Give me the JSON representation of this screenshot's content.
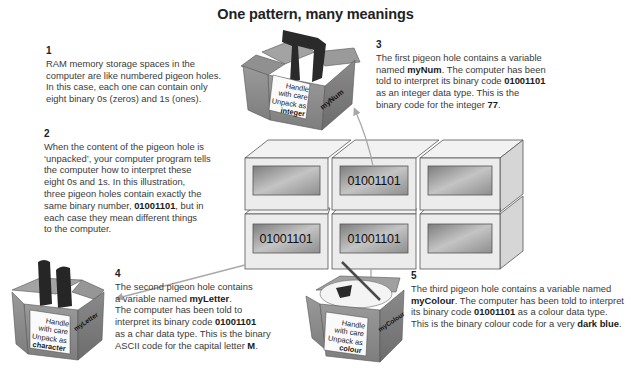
{
  "title": "One pattern, many meanings",
  "binary": "01001101",
  "steps": [
    {
      "number": "1",
      "lines": [
        "RAM memory storage spaces in the",
        "computer are like numbered pigeon holes.",
        "In this case, each one can contain only",
        "eight binary 0s (zeros) and 1s (ones)."
      ]
    },
    {
      "number": "2",
      "l1": "When the content of the pigeon hole is",
      "l2": "‘unpacked’, your computer program tells",
      "l3": "the computer how to interpret these",
      "l4": "eight 0s and 1s. In this illustration,",
      "l5": "three pigeon holes contain exactly the",
      "l6a": "same binary number, ",
      "l6b": "01001101",
      "l6c": ", but in",
      "l7": "each case they mean different things",
      "l8": "to the computer."
    },
    {
      "number": "3",
      "l1": "The first pigeon hole contains a variable",
      "l2a": "named ",
      "l2b": "myNum",
      "l2c": ". The computer has been",
      "l3a": "told to interpret its binary code ",
      "l3b": "01001101",
      "l4": "as an integer data type. This is the",
      "l5a": "binary code for the integer ",
      "l5b": "77",
      "l5c": "."
    },
    {
      "number": "4",
      "l1": "The second pigeon hole contains",
      "l2a": "a variable named ",
      "l2b": "myLetter",
      "l2c": ".",
      "l3": "The computer has been told to",
      "l4a": "interpret its binary code ",
      "l4b": "01001101",
      "l5": "as a char data type. This is the binary",
      "l6a": "ASCII code for the capital letter ",
      "l6b": "M",
      "l6c": "."
    },
    {
      "number": "5",
      "l1": "The third pigeon hole contains a variable named",
      "l2a": "myColour",
      "l2b": ". The computer has been told to interpret",
      "l3a": "its binary code ",
      "l3b": "01001101",
      "l3c": " as a colour data type.",
      "l4a": "This is the binary colour code for a very ",
      "l4b": "dark blue",
      "l4c": "."
    }
  ],
  "boxes": [
    {
      "variable": "myNum",
      "label": [
        "Handle",
        "with care",
        "Unpack as"
      ],
      "type": "integer"
    },
    {
      "variable": "myLetter",
      "label": [
        "Handle",
        "with care",
        "Unpack as"
      ],
      "type": "character"
    },
    {
      "variable": "myColour",
      "label": [
        "Handle",
        "with care",
        "Unpack as"
      ],
      "type": "colour"
    }
  ],
  "grid": {
    "cells": [
      {
        "row": 0,
        "col": 0,
        "value": ""
      },
      {
        "row": 0,
        "col": 1,
        "value": "01001101"
      },
      {
        "row": 0,
        "col": 2,
        "value": ""
      },
      {
        "row": 1,
        "col": 0,
        "value": "01001101"
      },
      {
        "row": 1,
        "col": 1,
        "value": "01001101"
      },
      {
        "row": 1,
        "col": 2,
        "value": ""
      }
    ]
  },
  "colors": {
    "box_cardboard": "#8a8a8a",
    "arrow": "#a8a8a8",
    "cell_face": "#e9e9e9",
    "cell_window": "#9a9a9a"
  }
}
